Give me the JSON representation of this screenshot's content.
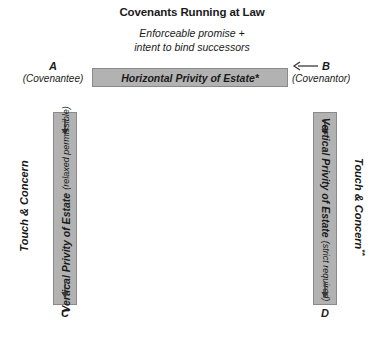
{
  "diagram": {
    "title": "Covenants Running at Law",
    "subtitle_line1": "Enforceable promise +",
    "subtitle_line2": "intent to bind successors",
    "colors": {
      "bar_fill": "#b2b2b2",
      "bar_border": "#8a8a8a",
      "text": "#1a1a1a",
      "background": "#ffffff"
    }
  },
  "horizontal_bar": {
    "label": "Horizontal Privity of Estate*"
  },
  "vertical_bar_left": {
    "label": "Vertical Privity of Estate",
    "qualifier": "(relaxed permissible)"
  },
  "vertical_bar_right": {
    "label": "Vertical Privity of Estate",
    "qualifier": "(strict required)"
  },
  "side_labels": {
    "left": "Touch & Concern",
    "right": "Touch & Concern",
    "right_superscript": "**"
  },
  "nodes": {
    "a": {
      "letter": "A",
      "role": "(Covenantee)"
    },
    "b": {
      "letter": "B",
      "role": "(Covenantor)"
    },
    "c": {
      "letter": "C"
    },
    "d": {
      "letter": "D"
    }
  },
  "icons": {
    "arrow_left": "arrow-left-icon",
    "arrow_down": "arrow-down-icon"
  }
}
